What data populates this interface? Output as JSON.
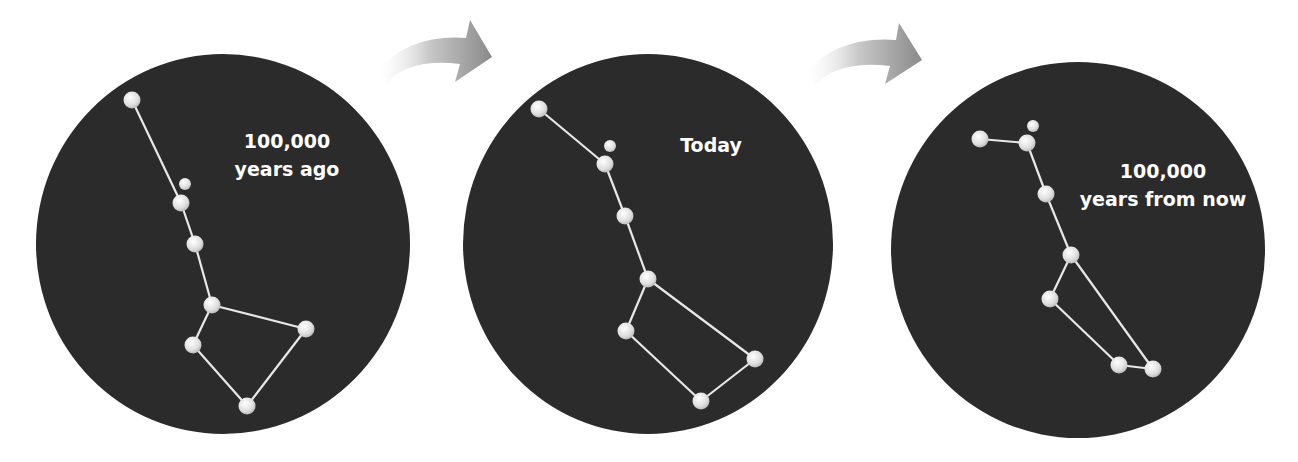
{
  "figure": {
    "colors": {
      "sky": "#2b2b2b",
      "star": "#e6e6e6",
      "line": "#e8e8e8",
      "arrow_dark": "#8c8c8c",
      "arrow_light": "#f2f2f2"
    },
    "panels": [
      {
        "id": "past",
        "label_line1": "100,000",
        "label_line2": "years ago"
      },
      {
        "id": "today",
        "label_line1": "Today",
        "label_line2": ""
      },
      {
        "id": "future",
        "label_line1": "100,000",
        "label_line2": "years from now"
      }
    ],
    "arrows": [
      {
        "from": "past",
        "to": "today"
      },
      {
        "from": "today",
        "to": "future"
      }
    ]
  }
}
